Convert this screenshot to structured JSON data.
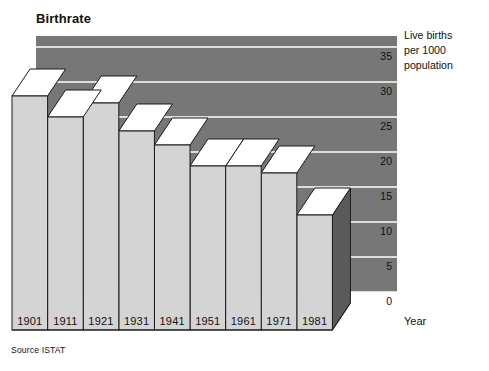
{
  "chart_data": {
    "type": "bar",
    "title": "Birthrate",
    "xlabel": "Year",
    "ylabel": "Live births per 1000 population",
    "categories": [
      "1901",
      "1911",
      "1921",
      "1931",
      "1941",
      "1951",
      "1961",
      "1971",
      "1981"
    ],
    "values": [
      28,
      25,
      27,
      23,
      21,
      18,
      18,
      17,
      11
    ],
    "ylim": [
      0,
      37.5
    ],
    "yticks": [
      "0",
      "5",
      "10",
      "15",
      "20",
      "25",
      "30",
      "35"
    ],
    "ytick_values": [
      0,
      5,
      10,
      15,
      20,
      25,
      30,
      35
    ],
    "grid": true,
    "legend": "none",
    "style": "3d-isometric-bars",
    "source": "Source ISTAT"
  },
  "title": "Birthrate",
  "axis": {
    "y_caption_line1": "Live births",
    "y_caption_line2": "per 1000",
    "y_caption_line3": "population",
    "x_name": "Year"
  },
  "footer": {
    "source": "Source ISTAT"
  },
  "colors": {
    "plot_background": "#777777",
    "gridline": "#ffffff",
    "bar_front": "#d4d4d4",
    "bar_top": "#ffffff",
    "bar_side": "#5a5a5a",
    "outline": "#1a1a1a",
    "text": "#111111",
    "page_background": "#ffffff"
  }
}
